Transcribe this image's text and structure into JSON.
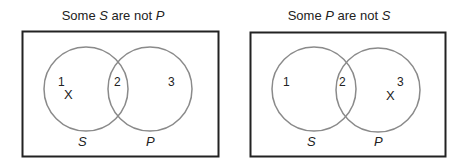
{
  "diagrams": [
    {
      "title_parts": [
        "Some ",
        "S",
        " are not ",
        "P"
      ],
      "regions": [
        "1",
        "2",
        "3"
      ],
      "x_mark": "X",
      "x_region": "1",
      "circle_labels": [
        "S",
        "P"
      ]
    },
    {
      "title_parts": [
        "Some ",
        "P",
        " are not ",
        "S"
      ],
      "regions": [
        "1",
        "2",
        "3"
      ],
      "x_mark": "X",
      "x_region": "3",
      "circle_labels": [
        "S",
        "P"
      ]
    }
  ],
  "colors": {
    "box": "#222222",
    "circle": "#8a8a8a",
    "text": "#222222"
  }
}
